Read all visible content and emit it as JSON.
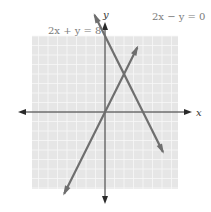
{
  "chart_data": {
    "type": "line",
    "title": "",
    "xlabel": "x",
    "ylabel": "y",
    "xlim": [
      -8,
      8
    ],
    "ylim": [
      -8,
      8
    ],
    "grid": true,
    "series": [
      {
        "name": "2x + y = 8",
        "label": "2x + y = 8",
        "slope": -2,
        "intercept": 8,
        "x_range": [
          -1.1,
          6.1
        ],
        "color": "#6e6e6e"
      },
      {
        "name": "2x − y = 0",
        "label": "2x − y = 0",
        "slope": 2,
        "intercept": 0,
        "x_range": [
          -4.3,
          3.4
        ],
        "color": "#6e6e6e"
      }
    ],
    "intersection": {
      "x": 2,
      "y": 4
    }
  },
  "colors": {
    "grid_fill": "#e6e6e6",
    "grid_line": "#f8f8f8",
    "axis": "#2a2a2a",
    "line": "#6e6e6e"
  }
}
